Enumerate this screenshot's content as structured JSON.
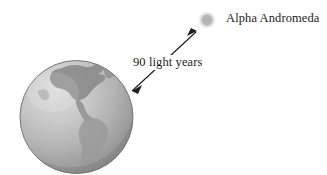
{
  "figure": {
    "background_color": "#ffffff",
    "earth": {
      "name": "Earth",
      "ocean_light_color": "#d2d2d2",
      "ocean_mid_color": "#b6b6b6",
      "ocean_dark_color": "#8f8f8f",
      "land_color": "#8d8d8d",
      "land_soft_color": "#a0a0a0",
      "outline_color": "#6e6e6e"
    },
    "star": {
      "label": "Alpha Andromeda",
      "glow_color": "#c9c9c9",
      "core_color": "#b3b3b3"
    },
    "distance": {
      "label": "90 light years",
      "value": 90,
      "unit": "light years",
      "arrow_color": "#1c1c1c",
      "arrow_style": "double-headed"
    }
  }
}
